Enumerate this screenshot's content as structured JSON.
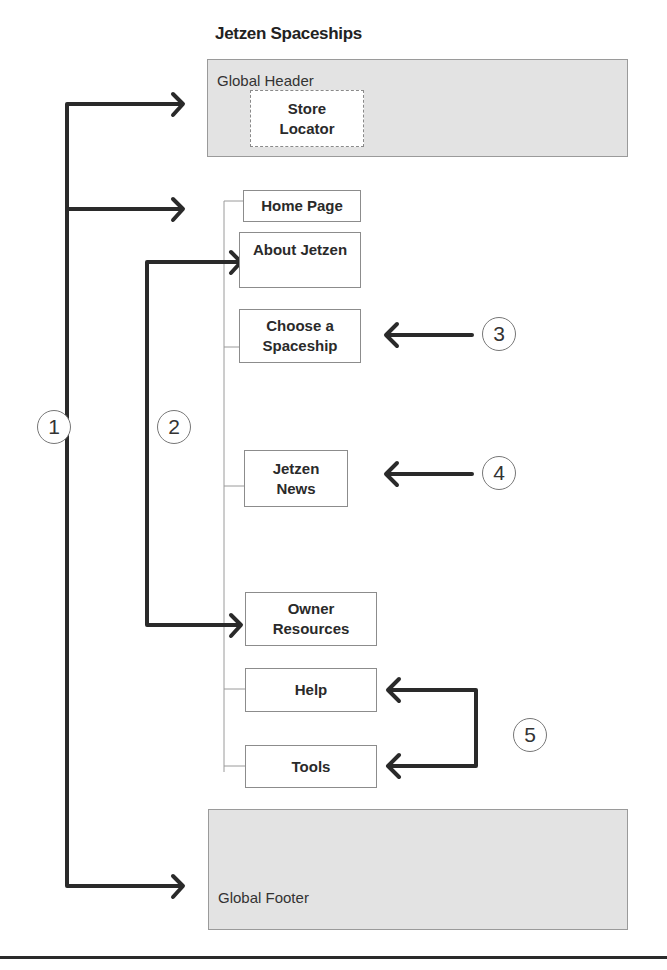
{
  "title": "Jetzen Spaceships",
  "global_header": {
    "label": "Global Header",
    "store_locator": "Store Locator"
  },
  "pages": [
    {
      "id": "home",
      "label": "Home Page"
    },
    {
      "id": "about",
      "label": "About Jetzen"
    },
    {
      "id": "choose",
      "label": "Choose a Spaceship"
    },
    {
      "id": "news",
      "label": "Jetzen News"
    },
    {
      "id": "owner",
      "label": "Owner Resources"
    },
    {
      "id": "help",
      "label": "Help"
    },
    {
      "id": "tools",
      "label": "Tools"
    }
  ],
  "global_footer": {
    "label": "Global Footer"
  },
  "callouts": [
    {
      "number": "1",
      "targets": [
        "Global Header",
        "Home Page",
        "Global Footer"
      ]
    },
    {
      "number": "2",
      "targets": [
        "About Jetzen",
        "Owner Resources"
      ]
    },
    {
      "number": "3",
      "targets": [
        "Choose a Spaceship"
      ]
    },
    {
      "number": "4",
      "targets": [
        "Jetzen News"
      ]
    },
    {
      "number": "5",
      "targets": [
        "Help",
        "Tools"
      ]
    }
  ],
  "colors": {
    "region_fill": "#e3e3e3",
    "arrow": "#2a2a2a",
    "box_border": "#8c8c8c"
  }
}
